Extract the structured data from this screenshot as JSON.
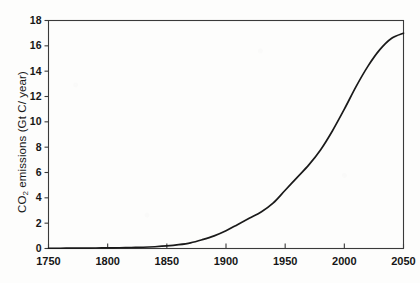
{
  "chart_data": {
    "type": "line",
    "title": "",
    "subtitle": "",
    "xlabel": "",
    "ylabel": "CO2 emissions (Gt C/ year)",
    "ylabel_prefix": "CO",
    "ylabel_sub": "2",
    "ylabel_suffix": " emissions (Gt C/ year)",
    "xlim": [
      1750,
      2050
    ],
    "ylim": [
      0,
      18
    ],
    "xticks": [
      1750,
      1800,
      1850,
      1900,
      1950,
      2000,
      2050
    ],
    "yticks": [
      0,
      2,
      4,
      6,
      8,
      10,
      12,
      14,
      16,
      18
    ],
    "xtick_labels": [
      "1750",
      "1800",
      "1850",
      "1900",
      "1950",
      "2000",
      "2050"
    ],
    "ytick_labels": [
      "0",
      "2",
      "4",
      "6",
      "8",
      "10",
      "12",
      "14",
      "16",
      "18"
    ],
    "grid": false,
    "legend": null,
    "legend_position": "none",
    "line_color": "#1a1a1a",
    "line_width": 1.7,
    "background_color": "#fdfdfc",
    "axis_color": "#3a3a3a",
    "series": [
      {
        "name": "CO2 emissions",
        "x": [
          1750,
          1760,
          1770,
          1780,
          1790,
          1800,
          1810,
          1820,
          1830,
          1840,
          1850,
          1860,
          1870,
          1880,
          1890,
          1900,
          1910,
          1920,
          1930,
          1940,
          1950,
          1960,
          1970,
          1980,
          1990,
          2000,
          2010,
          2020,
          2030,
          2040,
          2050
        ],
        "values": [
          0.02,
          0.02,
          0.03,
          0.03,
          0.04,
          0.05,
          0.06,
          0.08,
          0.1,
          0.14,
          0.2,
          0.3,
          0.45,
          0.7,
          1.0,
          1.4,
          1.9,
          2.4,
          2.9,
          3.6,
          4.6,
          5.6,
          6.6,
          7.8,
          9.3,
          11.0,
          12.8,
          14.4,
          15.7,
          16.6,
          17.0
        ]
      }
    ]
  },
  "axis_label": {
    "y": "CO2 emissions (Gt C/ year)"
  }
}
